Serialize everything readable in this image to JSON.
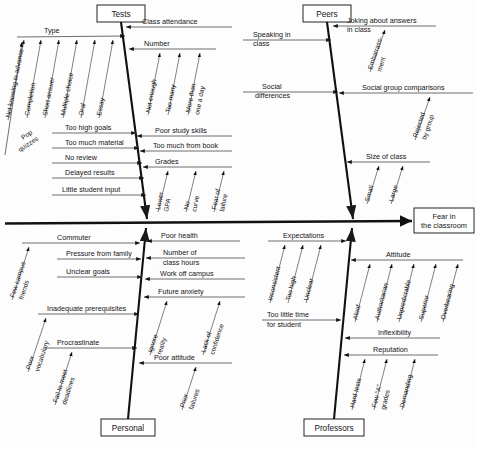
{
  "diagram": {
    "type": "fishbone-ishikawa",
    "effect": {
      "label": "Fear in\nthe classroom",
      "line1": "Fear in",
      "line2": "the classroom"
    },
    "categories": [
      {
        "id": "tests",
        "label": "Tests",
        "position": "top-left",
        "causes": [
          {
            "label": "Type",
            "side": "left",
            "sub": [
              "Not knowing in advance",
              "Completion",
              "Short answer",
              "Multiple choice",
              "Oral",
              "Essay"
            ]
          },
          {
            "label": "Pop quizzes",
            "side": "left",
            "sub": []
          },
          {
            "label": "Too high goals",
            "side": "left",
            "sub": []
          },
          {
            "label": "Too much material",
            "side": "left",
            "sub": []
          },
          {
            "label": "No review",
            "side": "left",
            "sub": []
          },
          {
            "label": "Delayed results",
            "side": "left",
            "sub": []
          },
          {
            "label": "Little student input",
            "side": "left",
            "sub": []
          },
          {
            "label": "Class attendance",
            "side": "right",
            "sub": []
          },
          {
            "label": "Number",
            "side": "right",
            "sub": [
              "Not enough",
              "Too many",
              "More than one a day"
            ]
          },
          {
            "label": "Poor study skills",
            "side": "right",
            "sub": []
          },
          {
            "label": "Too much from book",
            "side": "right",
            "sub": []
          },
          {
            "label": "Grades",
            "side": "right",
            "sub": [
              "Lower GPA",
              "No curve",
              "Fear of failure"
            ]
          }
        ]
      },
      {
        "id": "peers",
        "label": "Peers",
        "position": "top-right",
        "causes": [
          {
            "label": "Speaking in class",
            "side": "left",
            "sub": []
          },
          {
            "label": "Social differences",
            "side": "left",
            "sub": []
          },
          {
            "label": "Joking about answers in class",
            "side": "right",
            "sub": [
              "Embarrassment"
            ]
          },
          {
            "label": "Social group comparisons",
            "side": "right",
            "sub": [
              "Rejected by group"
            ]
          },
          {
            "label": "Size of class",
            "side": "right",
            "sub": [
              "Small",
              "Large"
            ]
          }
        ]
      },
      {
        "id": "personal",
        "label": "Personal",
        "position": "bottom-left",
        "causes": [
          {
            "label": "Commuter",
            "side": "left",
            "sub": [
              "Few campus friends"
            ]
          },
          {
            "label": "Pressure from family",
            "side": "left",
            "sub": []
          },
          {
            "label": "Unclear goals",
            "side": "left",
            "sub": []
          },
          {
            "label": "Inadequate prerequisites",
            "side": "left",
            "sub": [
              "Poor vocabulary"
            ]
          },
          {
            "label": "Procrastinate",
            "side": "left",
            "sub": [
              "Fail to meet deadlines"
            ]
          },
          {
            "label": "Poor health",
            "side": "right",
            "sub": []
          },
          {
            "label": "Number of class hours",
            "side": "right",
            "sub": []
          },
          {
            "label": "Work off campus",
            "side": "right",
            "sub": []
          },
          {
            "label": "Future anxiety",
            "side": "right",
            "sub": [
              "Ignore reality",
              "Lack of confidence"
            ]
          },
          {
            "label": "Poor attitude",
            "side": "right",
            "sub": [
              "Prior failures"
            ]
          }
        ]
      },
      {
        "id": "professors",
        "label": "Professors",
        "position": "bottom-right",
        "causes": [
          {
            "label": "Expectations",
            "side": "left",
            "sub": [
              "Inconsistent",
              "Too high",
              "Unclear"
            ]
          },
          {
            "label": "Too little time for student",
            "side": "left",
            "sub": []
          },
          {
            "label": "Attitude",
            "side": "right",
            "sub": [
              "Aloof",
              "Authoritarian",
              "Unpredictable",
              "Superior",
              "Overbearing"
            ]
          },
          {
            "label": "Inflexibility",
            "side": "right",
            "sub": []
          },
          {
            "label": "Reputation",
            "side": "right",
            "sub": [
              "Hard tests",
              "Few \"A\" grades",
              "Demanding"
            ]
          }
        ]
      }
    ]
  },
  "labels": {
    "tests": "Tests",
    "peers": "Peers",
    "personal": "Personal",
    "professors": "Professors",
    "effect_l1": "Fear in",
    "effect_l2": "the classroom",
    "type": "Type",
    "not_knowing": "Not knowing in advance",
    "completion": "Completion",
    "short_answer": "Short answer",
    "multiple_choice": "Multiple choice",
    "oral": "Oral",
    "essay": "Essay",
    "pop_quizzes_1": "Pop",
    "pop_quizzes_2": "quizzes",
    "too_high_goals": "Too high goals",
    "too_much_material": "Too much material",
    "no_review": "No review",
    "delayed_results": "Delayed results",
    "little_student_input": "Little student input",
    "class_attendance": "Class attendance",
    "number": "Number",
    "not_enough": "Not enough",
    "too_many": "Too many",
    "more_than_1": "More than",
    "more_than_2": "one a day",
    "poor_study_skills": "Poor study skills",
    "too_much_from_book": "Too much from book",
    "grades": "Grades",
    "lower_1": "Lower",
    "lower_2": "GPA",
    "no_curve_1": "No",
    "no_curve_2": "curve",
    "fear_of_1": "Fear of",
    "fear_of_2": "failure",
    "speaking_1": "Speaking in",
    "speaking_2": "class",
    "social_diff_1": "Social",
    "social_diff_2": "differences",
    "joking_1": "Joking about answers",
    "joking_2": "in class",
    "embarrass_1": "Embarrass-",
    "embarrass_2": "ment",
    "social_group": "Social group comparisons",
    "rejected_1": "Rejected",
    "rejected_2": "by group",
    "size_of_class": "Size of class",
    "small": "Small",
    "large": "Large",
    "commuter": "Commuter",
    "few_campus_1": "Few campus",
    "few_campus_2": "friends",
    "pressure_family": "Pressure from family",
    "unclear_goals": "Unclear goals",
    "inadequate_prereq": "Inadequate prerequisites",
    "poor_vocab_1": "Poor",
    "poor_vocab_2": "vocabulary",
    "procrastinate": "Procrastinate",
    "fail_meet_1": "Fail to meet",
    "fail_meet_2": "deadlines",
    "poor_health": "Poor health",
    "number_of_1": "Number of",
    "number_of_2": "class hours",
    "work_off_campus": "Work off campus",
    "future_anxiety": "Future anxiety",
    "ignore_1": "Ignore",
    "ignore_2": "reality",
    "lack_conf_1": "Lack of",
    "lack_conf_2": "confidence",
    "poor_attitude": "Poor attitude",
    "prior_1": "Prior",
    "prior_2": "failures",
    "expectations": "Expectations",
    "inconsistent": "Inconsistent",
    "too_high": "Too high",
    "unclear": "Unclear",
    "too_little_1": "Too little time",
    "too_little_2": "for student",
    "attitude": "Attitude",
    "aloof": "Aloof",
    "authoritarian": "Authoritarian",
    "unpredictable": "Unpredictable",
    "superior": "Superior",
    "overbearing": "Overbearing",
    "inflexibility": "Inflexibility",
    "reputation": "Reputation",
    "hard_tests": "Hard tests",
    "few_a_1": "Few \"A\"",
    "few_a_2": "grades",
    "demanding": "Demanding"
  },
  "colors": {
    "spine": "#111111",
    "bone": "#111111",
    "twig": "#4a4a4a",
    "background": "#fdfdfd",
    "box_border": "#222222"
  }
}
